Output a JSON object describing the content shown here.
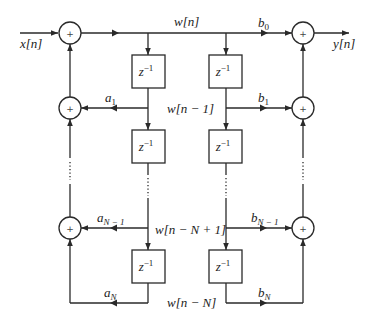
{
  "diagram": {
    "type": "IIR direct form II signal-flow block diagram",
    "input_label": "x[n]",
    "output_label": "y[n]",
    "adder_symbol": "+",
    "delay_label": "z",
    "delay_exponent": "−1",
    "state_labels": {
      "w0": "w[n]",
      "w1": "w[n − 1]",
      "wN1": "w[n − N + 1]",
      "wN": "w[n − N]"
    },
    "feedback_coefficients": {
      "a1": {
        "base": "a",
        "sub": "1"
      },
      "aN1": {
        "base": "a",
        "sub": "N − 1"
      },
      "aN": {
        "base": "a",
        "sub": "N"
      }
    },
    "feedforward_coefficients": {
      "b0": {
        "base": "b",
        "sub": "0"
      },
      "b1": {
        "base": "b",
        "sub": "1"
      },
      "bN1": {
        "base": "b",
        "sub": "N − 1"
      },
      "bN": {
        "base": "b",
        "sub": "N"
      }
    },
    "ellipsis": "⋮"
  }
}
